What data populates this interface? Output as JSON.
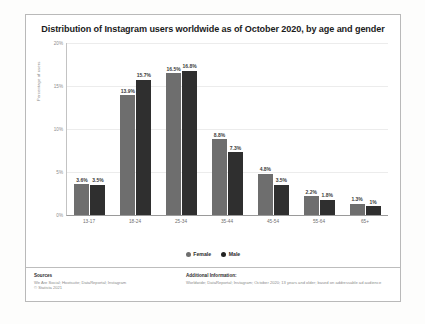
{
  "chart_data": {
    "type": "bar",
    "title": "Distribution of Instagram users worldwide as of October 2020, by age and gender",
    "xlabel": "",
    "ylabel": "Percentage of users",
    "ylim": [
      0,
      20
    ],
    "yticks": [
      "0%",
      "5%",
      "10%",
      "15%",
      "20%"
    ],
    "grid": true,
    "legend_position": "bottom-center",
    "categories": [
      "13-17",
      "18-24",
      "25-34",
      "35-44",
      "45-54",
      "55-64",
      "65+"
    ],
    "series": [
      {
        "name": "Female",
        "color": "#6e6e6e",
        "values": [
          3.6,
          13.9,
          16.5,
          8.8,
          4.8,
          2.2,
          1.3
        ],
        "labels": [
          "3.6%",
          "13.9%",
          "16.5%",
          "8.8%",
          "4.8%",
          "2.2%",
          "1.3%"
        ]
      },
      {
        "name": "Male",
        "color": "#2f2f2f",
        "values": [
          3.5,
          15.7,
          16.8,
          7.3,
          3.5,
          1.8,
          1.0
        ],
        "labels": [
          "3.5%",
          "15.7%",
          "16.8%",
          "7.3%",
          "3.5%",
          "1.8%",
          "1%"
        ]
      }
    ]
  },
  "footer": {
    "sources_heading": "Sources",
    "sources_body": "We Are Social; Hootsuite; DataReportal; Instagram\n© Statista 2021",
    "additional_heading": "Additional Information:",
    "additional_body": "Worldwide; DataReportal; Instagram; October 2020; 13 years and older; based on addressable ad audience"
  }
}
